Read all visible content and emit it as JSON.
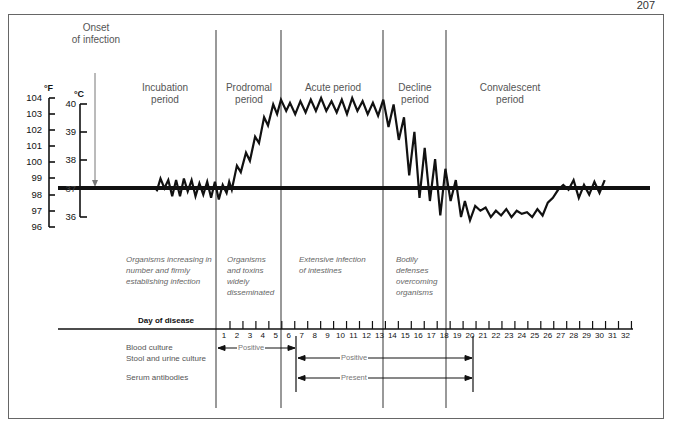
{
  "page": {
    "number": "207"
  },
  "onset": {
    "line1": "Onset",
    "line2": "of infection"
  },
  "axes": {
    "fahrenheit": {
      "unit": "°F",
      "ticks": [
        "104",
        "103",
        "102",
        "101",
        "100",
        "99",
        "98",
        "97",
        "96"
      ]
    },
    "celsius": {
      "unit": "°C",
      "ticks": [
        "40",
        "39",
        "38",
        "37",
        "36"
      ]
    }
  },
  "periods": [
    {
      "name_1": "Incubation",
      "name_2": "period",
      "desc": [
        "Organisms increasing in",
        "number and firmly",
        "establishing infection"
      ]
    },
    {
      "name_1": "Prodromal",
      "name_2": "period",
      "desc": [
        "Organisms",
        "and toxins",
        "widely",
        "disseminated"
      ]
    },
    {
      "name_1": "Acute period",
      "name_2": "",
      "desc": [
        "Extensive infection",
        "of intestines"
      ]
    },
    {
      "name_1": "Decline",
      "name_2": "period",
      "desc": [
        "Bodily",
        "defenses",
        "overcoming",
        "organisms"
      ]
    },
    {
      "name_1": "Convalescent",
      "name_2": "period",
      "desc": []
    }
  ],
  "timeline": {
    "title": "Day of disease",
    "days": [
      "1",
      "2",
      "3",
      "4",
      "5",
      "6",
      "7",
      "8",
      "9",
      "10",
      "11",
      "12",
      "13",
      "14",
      "15",
      "16",
      "17",
      "18",
      "19",
      "20",
      "21",
      "22",
      "23",
      "24",
      "25",
      "26",
      "27",
      "28",
      "29",
      "30",
      "31",
      "32"
    ],
    "rows": [
      {
        "label": "Blood culture",
        "result": "Positive",
        "from_day": 1,
        "to_day": 6
      },
      {
        "label": "Stool and urine culture",
        "result": "Positive",
        "from_day": 6.5,
        "to_day": 20.5
      },
      {
        "label": "Serum antibodies",
        "result": "Present",
        "from_day": 6.5,
        "to_day": 20.5
      }
    ]
  },
  "chart_data": {
    "type": "line",
    "xlabel": "Day of disease",
    "ylabel": "Temperature (°F / °C)",
    "ylim_f": [
      96,
      104
    ],
    "ylim_c": [
      36,
      40
    ],
    "reference_line": {
      "label": "Normal body temperature",
      "value_f": 98.6,
      "value_c": 37
    },
    "periods": [
      {
        "name": "Incubation period",
        "before_day": 1
      },
      {
        "name": "Prodromal period",
        "days": [
          1,
          5.5
        ]
      },
      {
        "name": "Acute period",
        "days": [
          5.5,
          13.5
        ]
      },
      {
        "name": "Decline period",
        "days": [
          13.5,
          18.5
        ]
      },
      {
        "name": "Convalescent period",
        "days": [
          18.5,
          32
        ]
      }
    ],
    "series": [
      {
        "name": "Body temperature (°F)",
        "points": [
          [
            -4.2,
            98.2
          ],
          [
            -3.9,
            99.0
          ],
          [
            -3.6,
            98.4
          ],
          [
            -3.3,
            98.9
          ],
          [
            -3.0,
            97.9
          ],
          [
            -2.7,
            98.9
          ],
          [
            -2.4,
            97.9
          ],
          [
            -2.1,
            99.0
          ],
          [
            -1.8,
            98.2
          ],
          [
            -1.5,
            98.9
          ],
          [
            -1.2,
            97.9
          ],
          [
            -0.9,
            98.7
          ],
          [
            -0.6,
            98.0
          ],
          [
            -0.3,
            98.8
          ],
          [
            0.0,
            97.8
          ],
          [
            0.3,
            98.8
          ],
          [
            0.6,
            97.7
          ],
          [
            0.9,
            98.6
          ],
          [
            1.2,
            98.1
          ],
          [
            1.4,
            98.8
          ],
          [
            1.6,
            98.3
          ],
          [
            2.0,
            99.8
          ],
          [
            2.3,
            99.4
          ],
          [
            2.7,
            100.6
          ],
          [
            3.0,
            100.1
          ],
          [
            3.4,
            101.6
          ],
          [
            3.7,
            101.2
          ],
          [
            4.1,
            102.8
          ],
          [
            4.4,
            102.3
          ],
          [
            4.8,
            103.6
          ],
          [
            5.1,
            103.0
          ],
          [
            5.4,
            103.9
          ],
          [
            5.8,
            103.2
          ],
          [
            6.1,
            103.7
          ],
          [
            6.5,
            103.0
          ],
          [
            6.9,
            103.8
          ],
          [
            7.3,
            103.1
          ],
          [
            7.7,
            103.9
          ],
          [
            8.1,
            103.2
          ],
          [
            8.5,
            104.0
          ],
          [
            8.9,
            103.2
          ],
          [
            9.3,
            103.8
          ],
          [
            9.7,
            103.1
          ],
          [
            10.1,
            103.9
          ],
          [
            10.5,
            103.0
          ],
          [
            10.9,
            104.0
          ],
          [
            11.3,
            103.2
          ],
          [
            11.7,
            103.8
          ],
          [
            12.1,
            103.0
          ],
          [
            12.5,
            103.7
          ],
          [
            12.9,
            102.9
          ],
          [
            13.3,
            103.9
          ],
          [
            13.7,
            102.2
          ],
          [
            14.1,
            103.6
          ],
          [
            14.5,
            101.4
          ],
          [
            14.9,
            102.8
          ],
          [
            15.3,
            99.2
          ],
          [
            15.7,
            101.9
          ],
          [
            16.1,
            97.8
          ],
          [
            16.5,
            100.9
          ],
          [
            16.9,
            97.6
          ],
          [
            17.3,
            100.2
          ],
          [
            17.7,
            96.7
          ],
          [
            18.1,
            99.6
          ],
          [
            18.5,
            97.6
          ],
          [
            18.9,
            98.9
          ],
          [
            19.3,
            96.6
          ],
          [
            19.6,
            97.6
          ],
          [
            20.0,
            96.4
          ],
          [
            20.4,
            97.3
          ],
          [
            20.8,
            97.0
          ],
          [
            21.2,
            97.2
          ],
          [
            21.6,
            96.6
          ],
          [
            22.0,
            97.0
          ],
          [
            22.4,
            96.7
          ],
          [
            22.8,
            97.1
          ],
          [
            23.2,
            96.6
          ],
          [
            23.6,
            97.0
          ],
          [
            24.0,
            96.8
          ],
          [
            24.4,
            96.9
          ],
          [
            24.8,
            96.6
          ],
          [
            25.2,
            97.1
          ],
          [
            25.6,
            96.7
          ],
          [
            26.0,
            97.5
          ],
          [
            26.4,
            97.8
          ],
          [
            26.8,
            98.3
          ],
          [
            27.2,
            98.6
          ],
          [
            27.6,
            98.3
          ],
          [
            28.0,
            98.9
          ],
          [
            28.4,
            97.8
          ],
          [
            28.8,
            98.6
          ],
          [
            29.2,
            98.0
          ],
          [
            29.6,
            98.8
          ],
          [
            30.0,
            98.1
          ],
          [
            30.4,
            98.9
          ]
        ]
      }
    ]
  }
}
